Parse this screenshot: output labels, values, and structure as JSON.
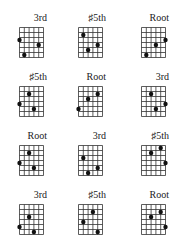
{
  "layout": {
    "strings": 6,
    "frets": 6,
    "columns_x": [
      19,
      78,
      141
    ],
    "rows_y": [
      13,
      72,
      131,
      190
    ]
  },
  "diagrams": [
    {
      "label": "3rd",
      "dots": [
        [
          0,
          2
        ],
        [
          4,
          3
        ],
        [
          1,
          5
        ]
      ]
    },
    {
      "label": "♯5th",
      "dots": [
        [
          1,
          1
        ],
        [
          4,
          3
        ],
        [
          2,
          4
        ]
      ]
    },
    {
      "label": "Root",
      "dots": [
        [
          5,
          2
        ],
        [
          3,
          3
        ],
        [
          1,
          5
        ]
      ]
    },
    {
      "label": "♯5th",
      "dots": [
        [
          2,
          1
        ],
        [
          0,
          3
        ],
        [
          3,
          4
        ]
      ]
    },
    {
      "label": "Root",
      "dots": [
        [
          4,
          1
        ],
        [
          2,
          2
        ],
        [
          0,
          4
        ]
      ]
    },
    {
      "label": "3rd",
      "dots": [
        [
          2,
          1
        ],
        [
          5,
          3
        ],
        [
          3,
          4
        ]
      ]
    },
    {
      "label": "Root",
      "dots": [
        [
          2,
          1
        ],
        [
          0,
          3
        ],
        [
          3,
          4
        ]
      ]
    },
    {
      "label": "3rd",
      "dots": [
        [
          1,
          2
        ],
        [
          4,
          4
        ],
        [
          2,
          5
        ]
      ]
    },
    {
      "label": "♯5th",
      "dots": [
        [
          4,
          0
        ],
        [
          2,
          1
        ],
        [
          5,
          3
        ]
      ]
    },
    {
      "label": "3rd",
      "dots": [
        [
          2,
          2
        ],
        [
          0,
          4
        ],
        [
          3,
          5
        ]
      ]
    },
    {
      "label": "♯5th",
      "dots": [
        [
          3,
          1
        ],
        [
          1,
          3
        ],
        [
          4,
          5
        ]
      ]
    },
    {
      "label": "Root",
      "dots": [
        [
          4,
          1
        ],
        [
          2,
          2
        ],
        [
          5,
          4
        ]
      ]
    }
  ],
  "colors": {
    "grid_line": "#333333",
    "dot": "#111111",
    "label": "#222222",
    "background": "#ffffff"
  }
}
